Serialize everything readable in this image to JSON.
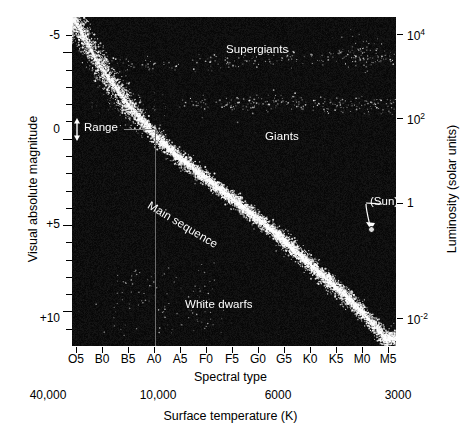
{
  "figure": {
    "background_color": "#0a0a0a",
    "star_color": "#ffffff"
  },
  "chart_data": {
    "type": "scatter",
    "title": "",
    "xlabel": "Spectral type",
    "xlabel_secondary": "Surface temperature (K)",
    "ylabel": "Visual absolute magnitude",
    "ylabel_secondary": "Luminosity (solar units)",
    "grid": false,
    "legend": "none",
    "x_axis": {
      "name": "Spectral type",
      "tick_labels": [
        "O5",
        "B0",
        "B5",
        "A0",
        "A5",
        "F0",
        "F5",
        "G0",
        "G5",
        "K0",
        "K5",
        "M0",
        "M5"
      ],
      "direction": "hot-to-cool (left to right)"
    },
    "x_axis_secondary": {
      "name": "Surface temperature (K)",
      "tick_labels": [
        "40,000",
        "10,000",
        "6000",
        "3000"
      ],
      "tick_positions_spectral": [
        "O5",
        "A0",
        "G0",
        "M0"
      ]
    },
    "y_axis": {
      "name": "Visual absolute magnitude",
      "tick_labels": [
        "-5",
        "0",
        "+5",
        "+10"
      ],
      "range": [
        -7,
        12
      ],
      "minor_tick_step": 1,
      "direction": "inverted (brighter at top)"
    },
    "y_axis_secondary": {
      "name": "Luminosity (solar units)",
      "tick_labels": [
        "10⁴",
        "10²",
        "1",
        "10⁻²"
      ],
      "tick_html": [
        "10<sup>4</sup>",
        "10<sup>2</sup>",
        "1",
        "10<sup>-2</sup>"
      ],
      "scale": "log"
    },
    "annotations": [
      {
        "name": "supergiants",
        "label": "Supergiants",
        "x_spectral": "F5",
        "y_magnitude": -5.0
      },
      {
        "name": "giants",
        "label": "Giants",
        "x_spectral": "G8",
        "y_magnitude": 1.0
      },
      {
        "name": "main-sequence",
        "label": "Main sequence",
        "x_spectral": "A7",
        "y_magnitude": 4.5,
        "rotation_deg": 31
      },
      {
        "name": "white-dwarfs",
        "label": "White dwarfs",
        "x_spectral": "A8",
        "y_magnitude": 9.6
      },
      {
        "name": "sun",
        "label": "(Sun)",
        "x_spectral": "G2",
        "y_magnitude": 4.8
      },
      {
        "name": "range",
        "label": "Range",
        "x_spectral": "O9",
        "y_magnitude": 0.0
      }
    ],
    "populations": [
      {
        "name": "main-sequence",
        "description": "Dense bright diagonal band running from upper-left (hot, luminous) to lower-right (cool, faint)",
        "point_count": 5200,
        "endpoints_magnitude": [
          -6.5,
          12.0
        ],
        "endpoints_spectral": [
          "O5",
          "M5"
        ]
      },
      {
        "name": "supergiants",
        "description": "Sparse near-horizontal band across the top",
        "point_count": 150,
        "mean_magnitude": -4.3
      },
      {
        "name": "giants",
        "description": "Sparse clumped horizontal band in the upper middle right",
        "point_count": 170,
        "mean_magnitude": 0.6
      },
      {
        "name": "white-dwarfs",
        "description": "Sparse scattered clump in the lower left quadrant",
        "point_count": 70,
        "mean_magnitude": 10.5
      }
    ]
  },
  "axis_labels": {
    "left_title": "Visual absolute magnitude",
    "right_title": "Luminosity (solar units)",
    "bottom_title": "Spectral type",
    "bottom_title_2": "Surface temperature (K)"
  }
}
